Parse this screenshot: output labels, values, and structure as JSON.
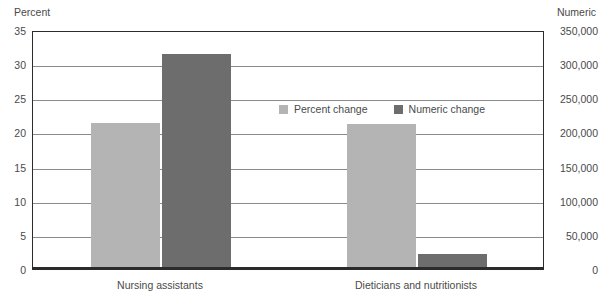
{
  "chart_data": {
    "type": "bar",
    "title": "",
    "xlabel": "",
    "ylabel": "Percent",
    "y2label": "Numeric",
    "categories": [
      "Nursing assistants",
      "Dieticians and nutritionists"
    ],
    "series": [
      {
        "name": "Percent change",
        "axis": "left",
        "color": "#b4b4b4",
        "values": [
          21.1,
          20.9
        ]
      },
      {
        "name": "Numeric change",
        "axis": "right",
        "color": "#6d6d6d",
        "values": [
          312000,
          19000
        ]
      }
    ],
    "ylim": [
      0,
      35
    ],
    "yticks": [
      0,
      5,
      10,
      15,
      20,
      25,
      30,
      35
    ],
    "ytick_labels": [
      "0",
      "5",
      "10",
      "15",
      "20",
      "25",
      "30",
      "35"
    ],
    "y2lim": [
      0,
      350000
    ],
    "y2ticks": [
      0,
      50000,
      100000,
      150000,
      200000,
      250000,
      300000,
      350000
    ],
    "y2tick_labels": [
      "0",
      "50,000",
      "100,000",
      "150,000",
      "200,000",
      "250,000",
      "300,000",
      "350,000"
    ],
    "grid": true,
    "grid_axis": "y",
    "legend_position": "inside-top-center"
  },
  "axes": {
    "left_title": "Percent",
    "right_title": "Numeric"
  },
  "legend": {
    "items": [
      {
        "label": "Percent change",
        "color": "#b4b4b4"
      },
      {
        "label": "Numeric change",
        "color": "#6d6d6d"
      }
    ]
  }
}
